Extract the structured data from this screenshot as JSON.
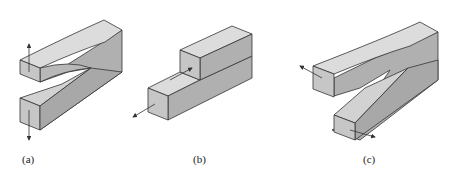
{
  "figure": {
    "panels": [
      {
        "label": "(a)",
        "mode": "opening",
        "load": "vertical arrows pulling arms apart"
      },
      {
        "label": "(b)",
        "mode": "sliding",
        "load": "in-plane shear arrows along length"
      },
      {
        "label": "(c)",
        "mode": "tearing",
        "load": "out-of-plane shear arrows"
      }
    ]
  },
  "colors": {
    "top_face": "#dcdcdc",
    "front_face": "#c6c6c6",
    "side_face": "#b0b0b0",
    "edge": "#333333"
  }
}
